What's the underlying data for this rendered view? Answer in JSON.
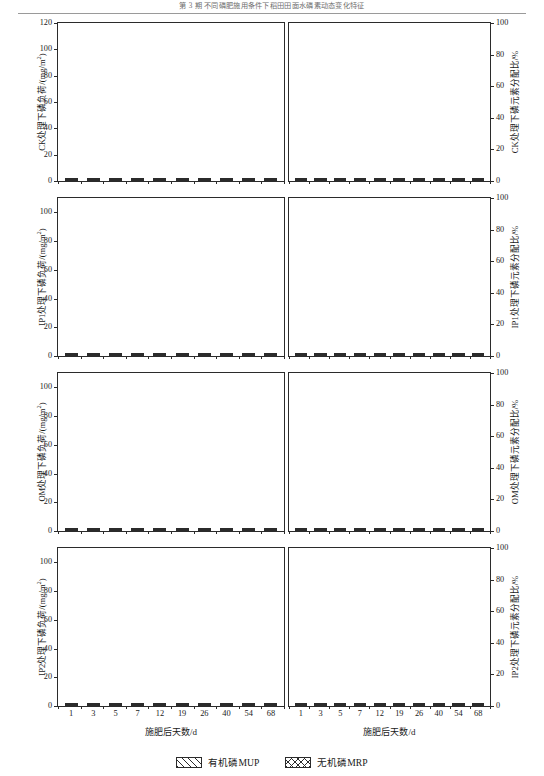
{
  "runhead": {
    "text": "第 3 期      不同磷肥施用条件下稻田田面水磷素动态变化特征"
  },
  "xaxis": {
    "caption": "施肥后天数/d",
    "categories": [
      "1",
      "3",
      "5",
      "7",
      "12",
      "19",
      "26",
      "40",
      "54",
      "68"
    ]
  },
  "legend": {
    "items": [
      {
        "name": "mup-swatch",
        "label": "有机磷MUP"
      },
      {
        "name": "mrp-swatch",
        "label": "无机磷MRP"
      }
    ]
  },
  "series_names": {
    "mup": "有机磷MUP",
    "mrp": "无机磷MRP"
  },
  "panels": [
    {
      "key": "ck",
      "left_axis_title": "CK处理下磷负荷/(mg/m",
      "left_axis_title_sup": "2",
      "left_axis_title_tail": ")",
      "right_axis_title": "CK处理下磷元素分配比/%",
      "left_ticks": [
        0,
        20,
        40,
        60,
        80,
        100,
        120
      ],
      "left_max": 120,
      "right_ticks": [
        0,
        20,
        40,
        60,
        80,
        100
      ],
      "right_max": 100
    },
    {
      "key": "ip1",
      "left_axis_title": "IP1处理下磷负荷/(mg/m",
      "left_axis_title_sup": "2",
      "left_axis_title_tail": ")",
      "right_axis_title": "IP1处理下磷元素分配比/%",
      "left_ticks": [
        0,
        20,
        40,
        60,
        80,
        100
      ],
      "left_max": 110,
      "right_ticks": [
        0,
        20,
        40,
        60,
        80,
        100
      ],
      "right_max": 100
    },
    {
      "key": "om",
      "left_axis_title": "OM处理下磷负荷/(mg/m",
      "left_axis_title_sup": "2",
      "left_axis_title_tail": ")",
      "right_axis_title": "OM处理下磷元素分配比/%",
      "left_ticks": [
        0,
        20,
        40,
        60,
        80,
        100
      ],
      "left_max": 110,
      "right_ticks": [
        0,
        20,
        40,
        60,
        80,
        100
      ],
      "right_max": 100
    },
    {
      "key": "ip2",
      "left_axis_title": "IP2处理下磷负荷/(mg/m",
      "left_axis_title_sup": "2",
      "left_axis_title_tail": ")",
      "right_axis_title": "IP2处理下磷元素分配比/%",
      "left_ticks": [
        0,
        20,
        40,
        60,
        80,
        100
      ],
      "left_max": 110,
      "right_ticks": [
        0,
        20,
        40,
        60,
        80,
        100
      ],
      "right_max": 100
    }
  ],
  "chart_data": [
    {
      "type": "bar",
      "id": "ck-load",
      "stacked": true,
      "title": "",
      "xlabel": "施肥后天数/d",
      "ylabel": "CK处理下磷负荷/(mg/m2)",
      "categories": [
        "1",
        "3",
        "5",
        "7",
        "12",
        "19",
        "26",
        "40",
        "54",
        "68"
      ],
      "ylim": [
        0,
        120
      ],
      "grid": false,
      "series": [
        {
          "name": "无机磷MRP",
          "values": [
            4.2,
            4.0,
            3.8,
            3.6,
            3.4,
            3.3,
            3.1,
            3.0,
            2.9,
            2.8
          ]
        },
        {
          "name": "有机磷MUP",
          "values": [
            3.0,
            2.9,
            2.8,
            2.7,
            2.6,
            2.6,
            2.5,
            2.5,
            2.4,
            2.4
          ]
        }
      ]
    },
    {
      "type": "bar",
      "id": "ck-percent",
      "stacked": true,
      "percent": true,
      "title": "",
      "xlabel": "施肥后天数/d",
      "ylabel": "CK处理下磷元素分配比/%",
      "categories": [
        "1",
        "3",
        "5",
        "7",
        "12",
        "19",
        "26",
        "40",
        "54",
        "68"
      ],
      "ylim": [
        0,
        100
      ],
      "grid": false,
      "series": [
        {
          "name": "无机磷MRP",
          "values": [
            64,
            53,
            54,
            60,
            61,
            49,
            59,
            66,
            66,
            61
          ]
        },
        {
          "name": "有机磷MUP",
          "values": [
            36,
            47,
            46,
            40,
            39,
            51,
            41,
            34,
            34,
            39
          ]
        }
      ]
    },
    {
      "type": "bar",
      "id": "ip1-load",
      "stacked": true,
      "title": "",
      "xlabel": "施肥后天数/d",
      "ylabel": "IP1处理下磷负荷/(mg/m2)",
      "categories": [
        "1",
        "3",
        "5",
        "7",
        "12",
        "19",
        "26",
        "40",
        "54",
        "68"
      ],
      "ylim": [
        0,
        110
      ],
      "grid": false,
      "series": [
        {
          "name": "无机磷MRP",
          "values": [
            74.0,
            42.0,
            23.5,
            16.5,
            7.0,
            5.0,
            3.6,
            2.8,
            3.4,
            2.6
          ]
        },
        {
          "name": "有机磷MUP",
          "values": [
            16.0,
            12.5,
            13.0,
            8.0,
            3.5,
            3.0,
            2.4,
            2.0,
            2.2,
            1.9
          ]
        }
      ]
    },
    {
      "type": "bar",
      "id": "ip1-percent",
      "stacked": true,
      "percent": true,
      "title": "",
      "xlabel": "施肥后天数/d",
      "ylabel": "IP1处理下磷元素分配比/%",
      "categories": [
        "1",
        "3",
        "5",
        "7",
        "12",
        "19",
        "26",
        "40",
        "54",
        "68"
      ],
      "ylim": [
        0,
        100
      ],
      "grid": false,
      "series": [
        {
          "name": "无机磷MRP",
          "values": [
            82,
            79,
            73,
            64,
            72,
            60,
            59,
            62,
            60,
            56
          ]
        },
        {
          "name": "有机磷MUP",
          "values": [
            18,
            21,
            27,
            36,
            28,
            40,
            41,
            38,
            40,
            44
          ]
        }
      ]
    },
    {
      "type": "bar",
      "id": "om-load",
      "stacked": true,
      "title": "",
      "xlabel": "施肥后天数/d",
      "ylabel": "OM处理下磷负荷/(mg/m2)",
      "categories": [
        "1",
        "3",
        "5",
        "7",
        "12",
        "19",
        "26",
        "40",
        "54",
        "68"
      ],
      "ylim": [
        0,
        110
      ],
      "grid": false,
      "series": [
        {
          "name": "无机磷MRP",
          "values": [
            57.0,
            41.0,
            28.0,
            16.5,
            8.0,
            5.0,
            4.2,
            3.2,
            3.0,
            3.2
          ]
        },
        {
          "name": "有机磷MUP",
          "values": [
            24.0,
            19.0,
            16.0,
            14.0,
            8.0,
            5.0,
            3.3,
            2.4,
            2.4,
            2.6
          ]
        }
      ]
    },
    {
      "type": "bar",
      "id": "om-percent",
      "stacked": true,
      "percent": true,
      "title": "",
      "xlabel": "施肥后天数/d",
      "ylabel": "OM处理下磷元素分配比/%",
      "categories": [
        "1",
        "3",
        "5",
        "7",
        "12",
        "19",
        "26",
        "40",
        "54",
        "68"
      ],
      "ylim": [
        0,
        100
      ],
      "grid": false,
      "series": [
        {
          "name": "无机磷MRP",
          "values": [
            68,
            62,
            59,
            54,
            53,
            52,
            49,
            45,
            52,
            56
          ]
        },
        {
          "name": "有机磷MUP",
          "values": [
            32,
            38,
            41,
            46,
            47,
            48,
            51,
            55,
            48,
            44
          ]
        }
      ]
    },
    {
      "type": "bar",
      "id": "ip2-load",
      "stacked": true,
      "title": "",
      "xlabel": "施肥后天数/d",
      "ylabel": "IP2处理下磷负荷/(mg/m2)",
      "categories": [
        "1",
        "3",
        "5",
        "7",
        "12",
        "19",
        "26",
        "40",
        "54",
        "68"
      ],
      "ylim": [
        0,
        110
      ],
      "grid": false,
      "series": [
        {
          "name": "无机磷MRP",
          "values": [
            90.0,
            57.0,
            33.0,
            17.0,
            8.5,
            6.0,
            4.4,
            2.8,
            3.0,
            2.6
          ]
        },
        {
          "name": "有机磷MUP",
          "values": [
            7.0,
            16.0,
            21.0,
            12.0,
            6.5,
            5.0,
            2.6,
            2.0,
            2.2,
            2.0
          ]
        }
      ]
    },
    {
      "type": "bar",
      "id": "ip2-percent",
      "stacked": true,
      "percent": true,
      "title": "",
      "xlabel": "施肥后天数/d",
      "ylabel": "IP2处理下磷元素分配比/%",
      "categories": [
        "1",
        "3",
        "5",
        "7",
        "12",
        "19",
        "26",
        "40",
        "54",
        "68"
      ],
      "ylim": [
        0,
        100
      ],
      "grid": false,
      "series": [
        {
          "name": "无机磷MRP",
          "values": [
            92,
            88,
            84,
            72,
            78,
            61,
            59,
            56,
            65,
            48
          ]
        },
        {
          "name": "有机磷MUP",
          "values": [
            8,
            12,
            16,
            28,
            22,
            39,
            41,
            44,
            35,
            52
          ]
        }
      ]
    }
  ]
}
